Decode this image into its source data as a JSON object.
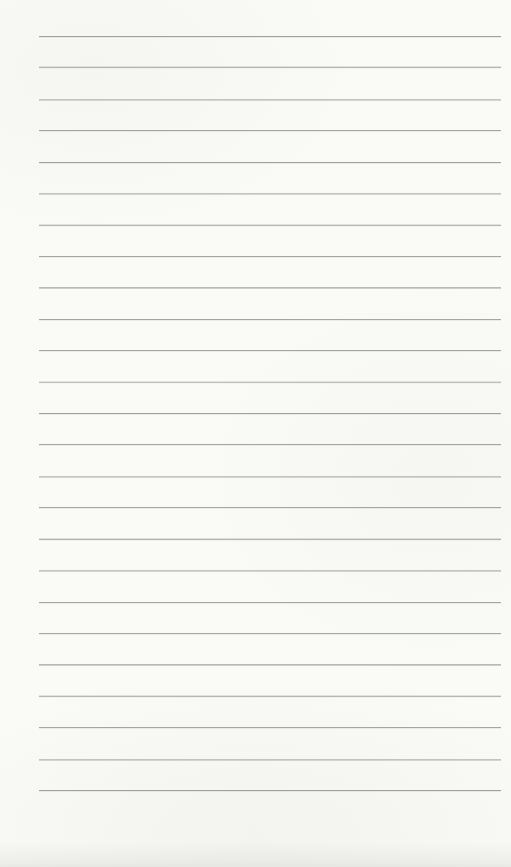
{
  "page": {
    "type": "blank-lined-notebook-page",
    "text_content": "",
    "ruled_lines": {
      "count": 25
    },
    "colors": {
      "paper": "#fafaf7",
      "rule_line": "#9c9c9a"
    }
  }
}
